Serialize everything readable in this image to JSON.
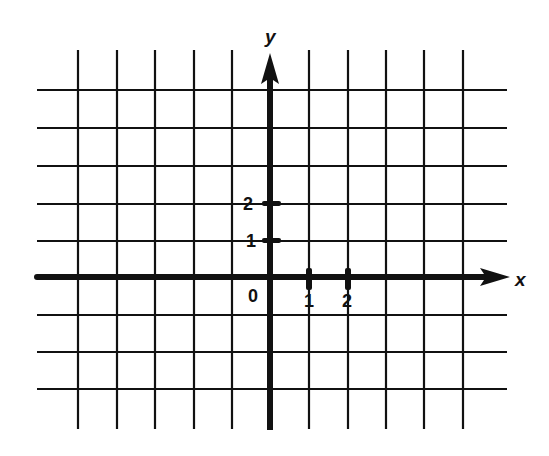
{
  "diagram": {
    "type": "coordinate-plane",
    "colors": {
      "ink": "#111111",
      "background": "#ffffff"
    },
    "axes": {
      "x": {
        "label": "x",
        "ticks": [
          {
            "value": 1,
            "label": "1"
          },
          {
            "value": 2,
            "label": "2"
          }
        ]
      },
      "y": {
        "label": "y",
        "ticks": [
          {
            "value": 1,
            "label": "1"
          },
          {
            "value": 2,
            "label": "2"
          }
        ]
      },
      "origin_label": "0"
    },
    "grid": {
      "x_range": [
        -5,
        5
      ],
      "y_range": [
        -3,
        5
      ],
      "vertical_lines_at": [
        -5,
        -4,
        -3,
        -2,
        -1,
        1,
        2,
        3,
        4,
        5
      ],
      "horizontal_lines_at": [
        -3,
        -2,
        -1,
        1,
        2,
        3,
        4,
        5
      ]
    }
  }
}
